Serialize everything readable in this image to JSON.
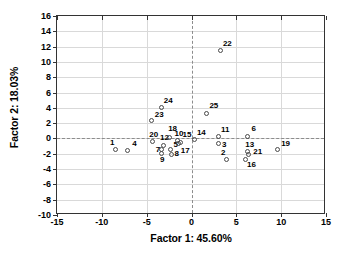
{
  "chart_data": {
    "type": "scatter",
    "title": "",
    "xlabel": "Factor 1: 45.60%",
    "ylabel": "Factor 2: 18.03%",
    "xlim": [
      -15,
      15
    ],
    "ylim": [
      -10,
      16
    ],
    "xticks": [
      -15,
      -10,
      -5,
      0,
      5,
      10,
      15
    ],
    "yticks": [
      -10,
      -8,
      -6,
      -4,
      -2,
      0,
      2,
      4,
      6,
      8,
      10,
      12,
      14,
      16
    ],
    "grid": true,
    "legend": "none",
    "reference_lines": {
      "x": 0,
      "y": 0,
      "style": "dashed"
    },
    "marker": {
      "shape": "circle",
      "filled": false,
      "color": "#4a4a4a"
    },
    "points": [
      {
        "label": "1",
        "x": -8.5,
        "y": -1.5,
        "lx": -9.1,
        "ly": -0.6
      },
      {
        "label": "2",
        "x": 3.9,
        "y": -2.8,
        "lx": 3.3,
        "ly": -1.9
      },
      {
        "label": "3",
        "x": 3.0,
        "y": -0.7,
        "lx": 3.4,
        "ly": -0.9
      },
      {
        "label": "4",
        "x": -7.1,
        "y": -1.6,
        "lx": -6.6,
        "ly": -0.7
      },
      {
        "label": "5",
        "x": -2.3,
        "y": -1.4,
        "lx": -2.0,
        "ly": -0.9
      },
      {
        "label": "6",
        "x": 6.3,
        "y": 0.3,
        "lx": 6.7,
        "ly": 1.2
      },
      {
        "label": "7",
        "x": -3.3,
        "y": -1.5,
        "lx": -4.0,
        "ly": -1.5
      },
      {
        "label": "8",
        "x": -2.2,
        "y": -2.1,
        "lx": -1.9,
        "ly": -2.0
      },
      {
        "label": "9",
        "x": -3.4,
        "y": -1.9,
        "lx": -3.5,
        "ly": -2.8
      },
      {
        "label": "10",
        "x": -1.6,
        "y": -0.3,
        "lx": -1.9,
        "ly": 0.6
      },
      {
        "label": "11",
        "x": 3.0,
        "y": 0.2,
        "lx": 3.3,
        "ly": 1.1
      },
      {
        "label": "12",
        "x": -3.1,
        "y": -0.9,
        "lx": -3.5,
        "ly": 0.0
      },
      {
        "label": "13",
        "x": 6.2,
        "y": -1.7,
        "lx": 6.0,
        "ly": -0.8
      },
      {
        "label": "14",
        "x": 0.3,
        "y": -0.1,
        "lx": 0.6,
        "ly": 0.7
      },
      {
        "label": "15",
        "x": -1.2,
        "y": -0.5,
        "lx": -1.0,
        "ly": 0.5
      },
      {
        "label": "16",
        "x": 6.0,
        "y": -2.7,
        "lx": 6.2,
        "ly": -3.5
      },
      {
        "label": "17",
        "x": -1.4,
        "y": -0.7,
        "lx": -1.2,
        "ly": -1.7
      },
      {
        "label": "18",
        "x": -2.5,
        "y": 0.1,
        "lx": -2.6,
        "ly": 1.2
      },
      {
        "label": "19",
        "x": 9.6,
        "y": -1.4,
        "lx": 10.0,
        "ly": -0.7
      },
      {
        "label": "20",
        "x": -4.3,
        "y": -0.4,
        "lx": -4.7,
        "ly": 0.5
      },
      {
        "label": "21",
        "x": 6.4,
        "y": -2.1,
        "lx": 6.9,
        "ly": -1.8
      },
      {
        "label": "22",
        "x": 3.2,
        "y": 11.5,
        "lx": 3.5,
        "ly": 12.4
      },
      {
        "label": "23",
        "x": -4.5,
        "y": 2.3,
        "lx": -4.1,
        "ly": 3.1
      },
      {
        "label": "24",
        "x": -3.4,
        "y": 4.0,
        "lx": -3.1,
        "ly": 4.9
      },
      {
        "label": "25",
        "x": 1.7,
        "y": 3.3,
        "lx": 2.0,
        "ly": 4.2
      }
    ]
  }
}
